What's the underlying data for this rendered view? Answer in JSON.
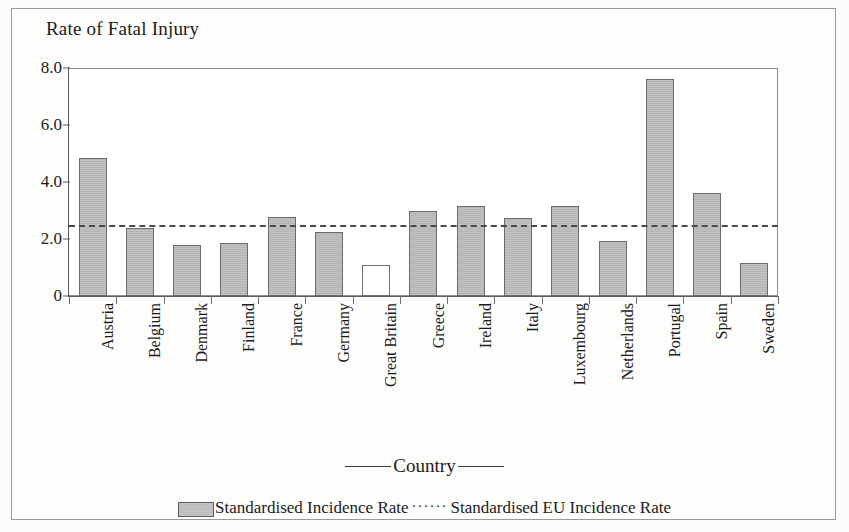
{
  "chart_data": {
    "type": "bar",
    "title": "Rate of Fatal Injury",
    "xlabel": "Country",
    "ylabel": "",
    "ylim": [
      0,
      8
    ],
    "yticks": [
      "0",
      "2.0",
      "4.0",
      "6.0",
      "8.0"
    ],
    "ytick_values": [
      0,
      2.0,
      4.0,
      6.0,
      8.0
    ],
    "grid": false,
    "legend_position": "bottom",
    "categories": [
      "Austria",
      "Belgium",
      "Denmark",
      "Finland",
      "France",
      "Germany",
      "Great Britain",
      "Greece",
      "Ireland",
      "Italy",
      "Luxembourg",
      "Netherlands",
      "Portugal",
      "Spain",
      "Sweden"
    ],
    "series": [
      {
        "name": "Standardised Incidence Rate",
        "values": [
          4.85,
          2.38,
          1.78,
          1.85,
          2.78,
          2.25,
          1.1,
          3.0,
          3.15,
          2.75,
          3.15,
          1.92,
          7.6,
          3.6,
          1.15
        ],
        "highlight_index": 6,
        "highlight_note": "Great Britain bar drawn unfilled (white)"
      }
    ],
    "reference_line": {
      "name": "Standardised EU Incidence Rate",
      "value": 2.5,
      "style": "dashed"
    },
    "legend": [
      {
        "label": "Standardised Incidence Rate",
        "marker": "filled-swatch"
      },
      {
        "label": "Standardised EU Incidence Rate",
        "marker": "dotted-line"
      }
    ]
  },
  "colors": {
    "bar_fill": "#bdbdbd",
    "bar_stroke": "#6b6b6b",
    "hollow_fill": "#ffffff",
    "reference_line": "#4a4a4a",
    "axis": "#5d5d5d",
    "text": "#1b1b1b",
    "page_background": "#fcfcfb"
  }
}
